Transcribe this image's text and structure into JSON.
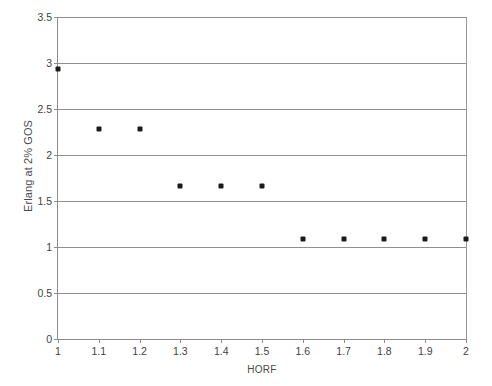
{
  "chart_data": {
    "type": "scatter",
    "title": "",
    "xlabel": "HORF",
    "ylabel": "Erlang at 2% GOS",
    "xlim": [
      1,
      2
    ],
    "ylim": [
      0,
      3.5
    ],
    "grid": "horizontal",
    "legend": "none",
    "marker": "small-filled-diamond",
    "marker_color": "#1a1a1a",
    "axis_color": "#8c8c8c",
    "gridline_color": "#8f8f8f",
    "background_color": "#ffffff",
    "xticks": [
      "1",
      "1.1",
      "1.2",
      "1.3",
      "1.4",
      "1.5",
      "1.6",
      "1.7",
      "1.8",
      "1.9",
      "2"
    ],
    "xtick_values": [
      1,
      1.1,
      1.2,
      1.3,
      1.4,
      1.5,
      1.6,
      1.7,
      1.8,
      1.9,
      2
    ],
    "yticks": [
      "0",
      "0.5",
      "1",
      "1.5",
      "2",
      "2.5",
      "3",
      "3.5"
    ],
    "ytick_values": [
      0,
      0.5,
      1,
      1.5,
      2,
      2.5,
      3,
      3.5
    ],
    "x": [
      1,
      1.1,
      1.2,
      1.3,
      1.4,
      1.5,
      1.6,
      1.7,
      1.8,
      1.9,
      2
    ],
    "values": [
      2.93,
      2.28,
      2.28,
      1.66,
      1.66,
      1.66,
      1.09,
      1.09,
      1.09,
      1.09,
      1.09
    ],
    "series": [
      {
        "name": "Erlang at 2% GOS",
        "x": [
          1,
          1.1,
          1.2,
          1.3,
          1.4,
          1.5,
          1.6,
          1.7,
          1.8,
          1.9,
          2
        ],
        "values": [
          2.93,
          2.28,
          2.28,
          1.66,
          1.66,
          1.66,
          1.09,
          1.09,
          1.09,
          1.09,
          1.09
        ]
      }
    ]
  }
}
